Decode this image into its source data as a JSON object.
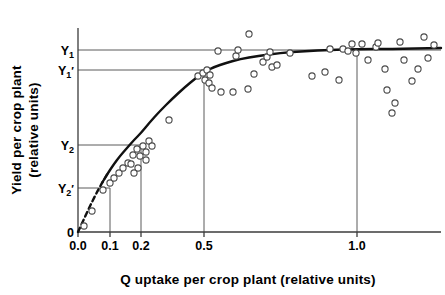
{
  "chart_data": {
    "type": "scatter",
    "title": "",
    "xlabel": "Q uptake per crop plant (relative units)",
    "ylabel_line1": "Yield per crop plant",
    "ylabel_line2": "(relative units)",
    "x_tick_labels": [
      "0.0",
      "0.1",
      "0.2",
      "0.5",
      "1.0"
    ],
    "x_tick_values": [
      0.0,
      0.1,
      0.2,
      0.5,
      1.0
    ],
    "x_tick_px": [
      78,
      110,
      141,
      204,
      357
    ],
    "y_tick_labels": [
      "Y",
      "Y",
      "Y",
      "Y",
      "0"
    ],
    "y_axis_labels": [
      {
        "base": "Y",
        "sub": "1",
        "prime": "",
        "px": 50
      },
      {
        "base": "Y",
        "sub": "1",
        "prime": "′",
        "px": 70
      },
      {
        "base": "Y",
        "sub": "2",
        "prime": "",
        "px": 145
      },
      {
        "base": "Y",
        "sub": "2",
        "prime": "′",
        "px": 188
      },
      {
        "base": "0",
        "sub": "",
        "prime": "",
        "px": 232
      }
    ],
    "grid": false,
    "legend": "none",
    "axis_note": "non-linear compressed x spacing; origin at 0.0",
    "reference_lines_horizontal": [
      {
        "label": "Y1",
        "y_px": 50,
        "x_from_px": 78,
        "x_to_px": 441
      },
      {
        "label": "Y1prime",
        "y_px": 70,
        "x_from_px": 78,
        "x_to_px": 204
      },
      {
        "label": "Y2",
        "y_px": 145,
        "x_from_px": 78,
        "x_to_px": 141
      },
      {
        "label": "Y2prime",
        "y_px": 188,
        "x_from_px": 78,
        "x_to_px": 110
      }
    ],
    "reference_lines_vertical": [
      {
        "label": "0.1",
        "x_px": 110,
        "y_from_px": 188,
        "y_to_px": 232
      },
      {
        "label": "0.2",
        "x_px": 141,
        "y_from_px": 145,
        "y_to_px": 232
      },
      {
        "label": "0.5",
        "x_px": 204,
        "y_from_px": 70,
        "y_to_px": 232
      },
      {
        "label": "1.0",
        "x_px": 357,
        "y_from_px": 50,
        "y_to_px": 232
      }
    ],
    "response_curve_px": [
      [
        78,
        232
      ],
      [
        84,
        219
      ],
      [
        90,
        206
      ],
      [
        96,
        194
      ],
      [
        102,
        183
      ],
      [
        108,
        173
      ],
      [
        114,
        164
      ],
      [
        120,
        156
      ],
      [
        127,
        148
      ],
      [
        134,
        140
      ],
      [
        141,
        133
      ],
      [
        150,
        122
      ],
      [
        160,
        111
      ],
      [
        172,
        99
      ],
      [
        185,
        87
      ],
      [
        196,
        78
      ],
      [
        204,
        72
      ],
      [
        214,
        67
      ],
      [
        226,
        63
      ],
      [
        240,
        59
      ],
      [
        258,
        56
      ],
      [
        280,
        53
      ],
      [
        305,
        51
      ],
      [
        330,
        50
      ],
      [
        357,
        49
      ],
      [
        390,
        49
      ],
      [
        441,
        48
      ]
    ],
    "curve_dashed_end_px": 108,
    "points_px": [
      [
        84,
        226
      ],
      [
        92,
        211
      ],
      [
        103,
        190
      ],
      [
        110,
        183
      ],
      [
        114,
        178
      ],
      [
        119,
        173
      ],
      [
        123,
        168
      ],
      [
        128,
        163
      ],
      [
        133,
        155
      ],
      [
        131,
        164
      ],
      [
        137,
        149
      ],
      [
        140,
        156
      ],
      [
        143,
        146
      ],
      [
        146,
        152
      ],
      [
        138,
        168
      ],
      [
        134,
        173
      ],
      [
        149,
        141
      ],
      [
        152,
        146
      ],
      [
        146,
        160
      ],
      [
        169,
        120
      ],
      [
        198,
        76
      ],
      [
        203,
        73
      ],
      [
        207,
        70
      ],
      [
        210,
        75
      ],
      [
        205,
        80
      ],
      [
        209,
        83
      ],
      [
        212,
        88
      ],
      [
        218,
        51
      ],
      [
        221,
        92
      ],
      [
        233,
        92
      ],
      [
        236,
        56
      ],
      [
        238,
        50
      ],
      [
        249,
        34
      ],
      [
        248,
        89
      ],
      [
        254,
        74
      ],
      [
        263,
        62
      ],
      [
        267,
        57
      ],
      [
        270,
        52
      ],
      [
        272,
        67
      ],
      [
        277,
        65
      ],
      [
        290,
        53
      ],
      [
        312,
        76
      ],
      [
        325,
        72
      ],
      [
        330,
        49
      ],
      [
        339,
        80
      ],
      [
        343,
        49
      ],
      [
        348,
        51
      ],
      [
        352,
        44
      ],
      [
        356,
        53
      ],
      [
        362,
        44
      ],
      [
        368,
        60
      ],
      [
        376,
        47
      ],
      [
        378,
        43
      ],
      [
        385,
        69
      ],
      [
        387,
        90
      ],
      [
        392,
        113
      ],
      [
        395,
        103
      ],
      [
        400,
        42
      ],
      [
        404,
        60
      ],
      [
        412,
        81
      ],
      [
        418,
        69
      ],
      [
        424,
        37
      ],
      [
        428,
        58
      ],
      [
        434,
        45
      ]
    ],
    "marker_style": "open-circle",
    "marker_radius_px": 3.1
  },
  "colors": {
    "curve": "#111111",
    "reference_line": "#5a5a5a",
    "axis": "#3b3b3b",
    "marker_stroke": "#4a4a4a",
    "marker_fill": "#ffffff",
    "background": "#ffffff",
    "text": "#000000"
  }
}
